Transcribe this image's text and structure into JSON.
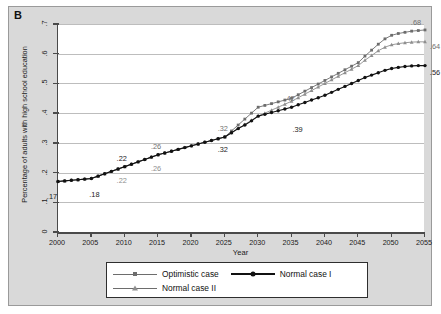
{
  "panel": {
    "label": "B"
  },
  "axes": {
    "ylabel": "Percentage of adults with high school education",
    "xlabel": "Year",
    "yticks": [
      "0",
      ".1",
      ".2",
      ".3",
      ".4",
      ".5",
      ".6",
      ".7"
    ],
    "xticks": [
      "2000",
      "2005",
      "2010",
      "2015",
      "2020",
      "2025",
      "2030",
      "2035",
      "2040",
      "2045",
      "2050",
      "2055"
    ]
  },
  "legend": {
    "items": [
      {
        "label": "Optimistic case",
        "marker": "square-marker",
        "color": "#6d6d6d"
      },
      {
        "label": "Normal case I",
        "marker": "circle-marker",
        "color": "#111111"
      },
      {
        "label": "Normal case II",
        "marker": "triangle-marker",
        "color": "#8e8e8e"
      }
    ]
  },
  "annotations": [
    {
      "text": ".17",
      "x": 2000,
      "y": 0.17,
      "series": "Normal case I",
      "tone": "dark",
      "dx": -6,
      "dy": 15
    },
    {
      "text": ".18",
      "x": 2005,
      "y": 0.18,
      "series": "Normal case I",
      "tone": "dark",
      "dx": 3,
      "dy": 15
    },
    {
      "text": ".22",
      "x": 2010,
      "y": 0.22,
      "series": "Optimistic case",
      "tone": "dark",
      "dx": -3,
      "dy": -9
    },
    {
      "text": ".22",
      "x": 2010,
      "y": 0.22,
      "series": "Normal case I",
      "tone": "gray",
      "dx": -3,
      "dy": 13
    },
    {
      "text": ".26",
      "x": 2015,
      "y": 0.26,
      "series": "Optimistic case",
      "tone": "mid",
      "dx": -2,
      "dy": -9
    },
    {
      "text": ".26",
      "x": 2015,
      "y": 0.26,
      "series": "Normal case I",
      "tone": "gray",
      "dx": -2,
      "dy": 13
    },
    {
      "text": ".32",
      "x": 2025,
      "y": 0.32,
      "series": "Optimistic case",
      "tone": "mid",
      "dx": -2,
      "dy": -9
    },
    {
      "text": ".32",
      "x": 2025,
      "y": 0.32,
      "series": "Normal case I",
      "tone": "dark",
      "dx": -2,
      "dy": 12
    },
    {
      "text": ".42",
      "x": 2035,
      "y": 0.42,
      "series": "Optimistic case",
      "tone": "mid",
      "dx": -2,
      "dy": -9
    },
    {
      "text": ".39",
      "x": 2035,
      "y": 0.39,
      "series": "Normal case I",
      "tone": "dark",
      "dx": 6,
      "dy": 13
    },
    {
      "text": ".68",
      "x": 2055,
      "y": 0.68,
      "series": "Optimistic case",
      "tone": "mid",
      "dx": -9,
      "dy": -8
    },
    {
      "text": ".64",
      "x": 2055,
      "y": 0.64,
      "series": "Normal case II",
      "tone": "mid",
      "dx": 10,
      "dy": 4
    },
    {
      "text": ".56",
      "x": 2055,
      "y": 0.56,
      "series": "Normal case I",
      "tone": "dark",
      "dx": 10,
      "dy": 6
    }
  ],
  "chart_data": {
    "type": "line",
    "title": "",
    "xlabel": "Year",
    "ylabel": "Percentage of adults with high school education",
    "xlim": [
      2000,
      2055
    ],
    "ylim": [
      0,
      0.7
    ],
    "grid": true,
    "legend_position": "bottom",
    "x": [
      2000,
      2001,
      2002,
      2003,
      2004,
      2005,
      2006,
      2007,
      2008,
      2009,
      2010,
      2011,
      2012,
      2013,
      2014,
      2015,
      2016,
      2017,
      2018,
      2019,
      2020,
      2021,
      2022,
      2023,
      2024,
      2025,
      2026,
      2027,
      2028,
      2029,
      2030,
      2031,
      2032,
      2033,
      2034,
      2035,
      2036,
      2037,
      2038,
      2039,
      2040,
      2041,
      2042,
      2043,
      2044,
      2045,
      2046,
      2047,
      2048,
      2049,
      2050,
      2051,
      2052,
      2053,
      2054,
      2055
    ],
    "series": [
      {
        "name": "Optimistic case",
        "color": "#6d6d6d",
        "marker": "square-marker",
        "values": [
          0.17,
          0.172,
          0.174,
          0.176,
          0.178,
          0.18,
          0.188,
          0.196,
          0.204,
          0.212,
          0.22,
          0.228,
          0.236,
          0.244,
          0.252,
          0.26,
          0.266,
          0.272,
          0.278,
          0.284,
          0.29,
          0.296,
          0.302,
          0.308,
          0.314,
          0.32,
          0.34,
          0.36,
          0.38,
          0.4,
          0.42,
          0.426,
          0.432,
          0.438,
          0.444,
          0.45,
          0.462,
          0.474,
          0.486,
          0.498,
          0.51,
          0.522,
          0.534,
          0.546,
          0.558,
          0.57,
          0.592,
          0.612,
          0.632,
          0.65,
          0.662,
          0.668,
          0.672,
          0.676,
          0.678,
          0.68
        ]
      },
      {
        "name": "Normal case II",
        "color": "#8e8e8e",
        "marker": "triangle-marker",
        "values": [
          0.17,
          0.172,
          0.174,
          0.176,
          0.178,
          0.18,
          0.188,
          0.196,
          0.204,
          0.212,
          0.22,
          0.228,
          0.236,
          0.244,
          0.252,
          0.26,
          0.266,
          0.272,
          0.278,
          0.284,
          0.29,
          0.296,
          0.302,
          0.308,
          0.314,
          0.32,
          0.334,
          0.348,
          0.362,
          0.376,
          0.39,
          0.4,
          0.41,
          0.42,
          0.43,
          0.44,
          0.452,
          0.464,
          0.476,
          0.488,
          0.5,
          0.512,
          0.524,
          0.536,
          0.548,
          0.56,
          0.578,
          0.594,
          0.61,
          0.622,
          0.63,
          0.634,
          0.637,
          0.639,
          0.64,
          0.64
        ]
      },
      {
        "name": "Normal case I",
        "color": "#111111",
        "marker": "circle-marker",
        "values": [
          0.17,
          0.172,
          0.174,
          0.176,
          0.178,
          0.18,
          0.188,
          0.196,
          0.204,
          0.212,
          0.22,
          0.228,
          0.236,
          0.244,
          0.252,
          0.26,
          0.266,
          0.272,
          0.278,
          0.284,
          0.29,
          0.296,
          0.302,
          0.308,
          0.314,
          0.32,
          0.334,
          0.348,
          0.36,
          0.374,
          0.39,
          0.396,
          0.402,
          0.408,
          0.414,
          0.42,
          0.428,
          0.436,
          0.444,
          0.452,
          0.46,
          0.47,
          0.48,
          0.49,
          0.5,
          0.51,
          0.52,
          0.528,
          0.536,
          0.544,
          0.55,
          0.554,
          0.557,
          0.559,
          0.56,
          0.56
        ]
      }
    ]
  }
}
